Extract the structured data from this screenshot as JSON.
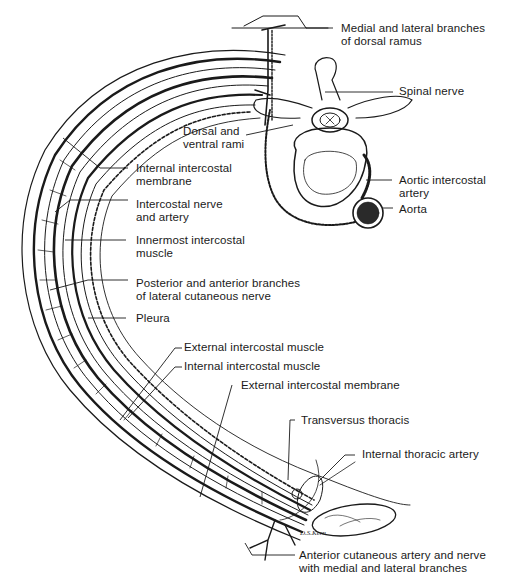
{
  "diagram": {
    "labels": [
      {
        "id": "medial-lateral-branches",
        "lines": [
          "Medial and lateral branches",
          "of dorsal ramus"
        ]
      },
      {
        "id": "spinal-nerve",
        "lines": [
          "Spinal nerve"
        ]
      },
      {
        "id": "dorsal-ventral-rami",
        "lines": [
          "Dorsal and",
          "ventral rami"
        ]
      },
      {
        "id": "internal-intercostal-membrane",
        "lines": [
          "Internal intercostal",
          "membrane"
        ]
      },
      {
        "id": "aortic-intercostal-artery",
        "lines": [
          "Aortic intercostal",
          "artery"
        ]
      },
      {
        "id": "aorta",
        "lines": [
          "Aorta"
        ]
      },
      {
        "id": "intercostal-nerve-artery",
        "lines": [
          "Intercostal nerve",
          "and artery"
        ]
      },
      {
        "id": "innermost-intercostal-muscle",
        "lines": [
          "Innermost intercostal",
          "muscle"
        ]
      },
      {
        "id": "lateral-cutaneous-branches",
        "lines": [
          "Posterior and anterior branches",
          "of lateral cutaneous nerve"
        ]
      },
      {
        "id": "pleura",
        "lines": [
          "Pleura"
        ]
      },
      {
        "id": "external-intercostal-muscle",
        "lines": [
          "External intercostal muscle"
        ]
      },
      {
        "id": "internal-intercostal-muscle",
        "lines": [
          "Internal intercostal muscle"
        ]
      },
      {
        "id": "external-intercostal-membrane",
        "lines": [
          "External intercostal membrane"
        ]
      },
      {
        "id": "transversus-thoracis",
        "lines": [
          "Transversus thoracis"
        ]
      },
      {
        "id": "internal-thoracic-artery",
        "lines": [
          "Internal thoracic artery"
        ]
      },
      {
        "id": "anterior-cutaneous",
        "lines": [
          "Anterior cutaneous artery and nerve",
          "with medial and lateral branches"
        ]
      }
    ],
    "signature": "D.S.Kern",
    "colors": {
      "ink": "#1a1a1a",
      "background": "#ffffff"
    }
  }
}
